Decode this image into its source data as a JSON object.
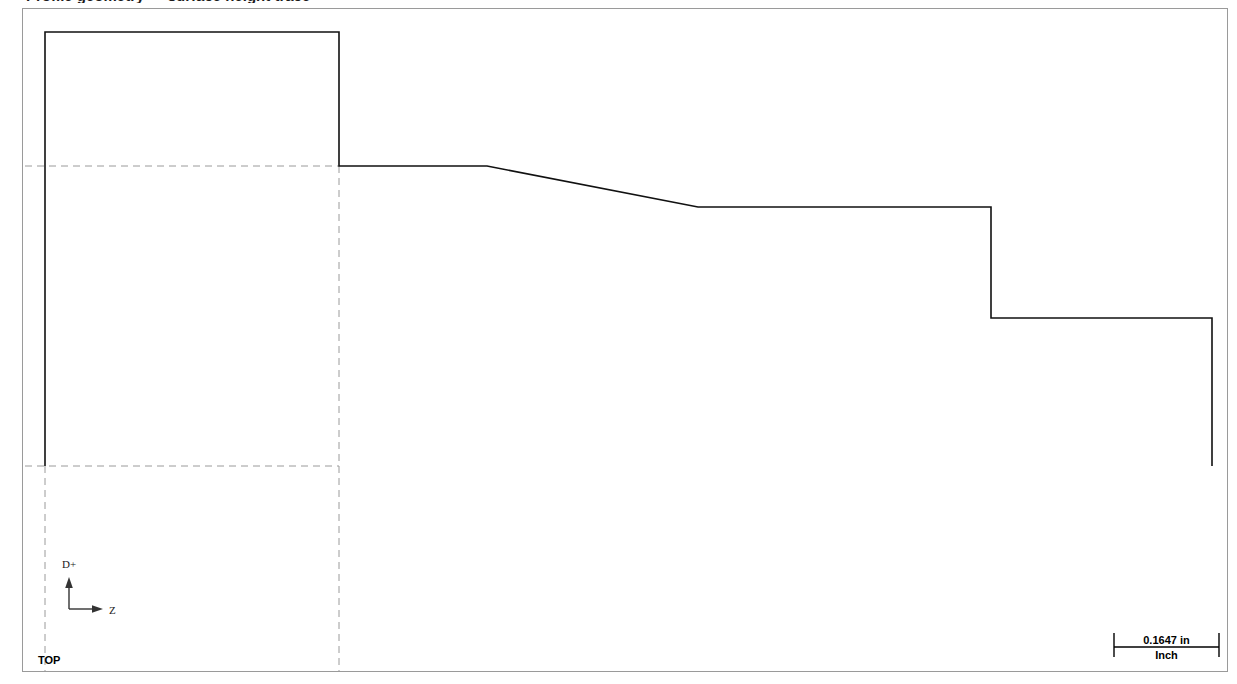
{
  "window": {
    "clipped_header_text": "Profile geometry — surface height trace",
    "background_color": "#ffffff",
    "frame_border_color": "#9a9a9a"
  },
  "plot": {
    "profile_color": "#111111",
    "reference_color": "#9a9a9a",
    "axis_color": "#333333"
  },
  "orientation": {
    "vertical_axis_label": "D+",
    "horizontal_axis_label": "Z",
    "corner_label": "TOP"
  },
  "scale_bar": {
    "length_label": "0.1647 in",
    "unit_label": "Inch"
  },
  "chart_data": {
    "type": "line",
    "title": "",
    "xlabel": "Z",
    "ylabel": "D+",
    "grid": false,
    "legend": null,
    "axis_orientation": {
      "x_positive": "right",
      "y_positive": "up",
      "note": "screen y increases downward; profile drawn in device pixels"
    },
    "xlim": [
      22,
      1228
    ],
    "ylim": [
      8,
      672
    ],
    "scale_bar_pixel_length": 105,
    "scale_bar_value": 0.1647,
    "scale_bar_unit": "in",
    "series": [
      {
        "name": "profile-outline",
        "style": "solid",
        "points": [
          [
            44,
            465
          ],
          [
            44,
            31
          ],
          [
            338,
            31
          ],
          [
            338,
            165
          ],
          [
            486,
            165
          ],
          [
            697,
            206
          ],
          [
            990,
            206
          ],
          [
            990,
            317
          ],
          [
            1211,
            317
          ],
          [
            1211,
            465
          ]
        ]
      }
    ],
    "reference_lines": [
      {
        "name": "upper-datum",
        "style": "dashed",
        "orientation": "horizontal",
        "y": 165,
        "x_start": 24,
        "x_end": 338
      },
      {
        "name": "lower-datum",
        "style": "dashed",
        "orientation": "horizontal",
        "y": 465,
        "x_start": 24,
        "x_end": 338
      },
      {
        "name": "left-extension",
        "style": "dashed",
        "orientation": "vertical",
        "x": 44,
        "y_start": 465,
        "y_end": 670
      },
      {
        "name": "step-extension",
        "style": "dashed",
        "orientation": "vertical",
        "x": 338,
        "y_start": 165,
        "y_end": 670
      }
    ]
  }
}
